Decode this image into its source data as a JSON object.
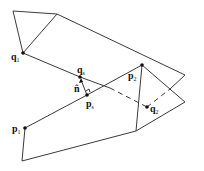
{
  "diagram": {
    "colors": {
      "line": "#3a3a3a",
      "point": "#111111",
      "background": "#ffffff"
    },
    "labels": {
      "q1": {
        "base": "q",
        "sub": "1"
      },
      "qs": {
        "base": "q",
        "sub": "s"
      },
      "n": {
        "base": "n̂",
        "sub": ""
      },
      "ps": {
        "base": "p",
        "sub": "s"
      },
      "p1": {
        "base": "p",
        "sub": "1"
      },
      "p2": {
        "base": "p",
        "sub": "2"
      },
      "q2": {
        "base": "q",
        "sub": "2"
      }
    }
  }
}
